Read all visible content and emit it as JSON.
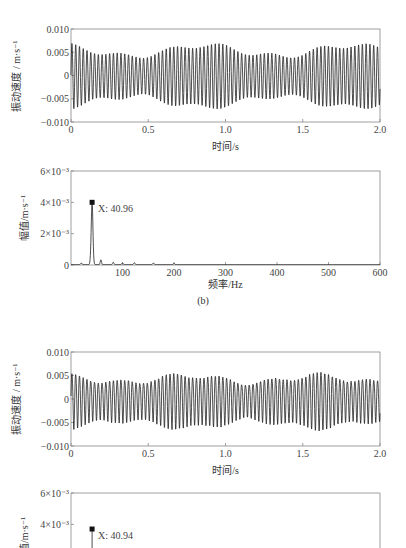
{
  "chart_data": [
    {
      "id": "wave1",
      "type": "line",
      "title": "",
      "xlabel": "时间/s",
      "ylabel": "振动速度 / m·s⁻¹",
      "xlim": [
        0,
        2.0
      ],
      "ylim": [
        -0.01,
        0.01
      ],
      "xticks": [
        "0",
        "0.5",
        "1.0",
        "1.5",
        "2.0"
      ],
      "yticks": [
        "0.010",
        "0.005",
        "0",
        "-0.005",
        "-0.010"
      ],
      "signal": {
        "frequency_hz": 40.96,
        "base_amplitude": 0.0055,
        "modulation_depth": 0.0012,
        "modulation_hz": 1.05,
        "noise": 0.0003
      },
      "grid": false
    },
    {
      "id": "spec1",
      "type": "line",
      "xlabel": "频率/Hz",
      "ylabel": "幅值/m·s⁻¹",
      "xlim": [
        0,
        600
      ],
      "ylim": [
        0,
        0.006
      ],
      "xticks": [
        "100",
        "200",
        "300",
        "400",
        "500",
        "600"
      ],
      "yticks": [
        "6×10⁻³",
        "4×10⁻³",
        "2×10⁻³",
        "0"
      ],
      "peaks": [
        {
          "x": 20,
          "y": 0.0001
        },
        {
          "x": 38,
          "y": 0.0002
        },
        {
          "x": 40.96,
          "y": 0.004
        },
        {
          "x": 58,
          "y": 0.0003
        },
        {
          "x": 82,
          "y": 0.00015
        },
        {
          "x": 100,
          "y": 0.0001
        },
        {
          "x": 123,
          "y": 0.00012
        },
        {
          "x": 160,
          "y": 0.0001
        },
        {
          "x": 200,
          "y": 8e-05
        }
      ],
      "annotation": {
        "label": "X: 40.96",
        "x": 40.96,
        "y": 0.004
      },
      "caption": "(b)"
    },
    {
      "id": "wave2",
      "type": "line",
      "xlabel": "时间/s",
      "ylabel": "振动速度 / m·s⁻¹",
      "xlim": [
        0,
        2.0
      ],
      "ylim": [
        -0.01,
        0.01
      ],
      "xticks": [
        "0",
        "0.5",
        "1.0",
        "1.5",
        "2.0"
      ],
      "yticks": [
        "0.010",
        "0.005",
        "0",
        "-0.005",
        "-0.010"
      ],
      "signal": {
        "frequency_hz": 40.94,
        "base_amplitude": 0.0048,
        "modulation_depth": 0.0008,
        "modulation_hz": 1.2,
        "noise": 0.0012
      },
      "grid": false
    },
    {
      "id": "spec2",
      "type": "line",
      "xlabel": "",
      "ylabel": "幅值/m·s⁻¹",
      "xlim": [
        0,
        600
      ],
      "ylim": [
        0,
        0.006
      ],
      "yticks": [
        "6×10⁻³",
        "4×10⁻³"
      ],
      "annotation": {
        "label": "X: 40.94",
        "x": 40.94,
        "y": 0.0037
      }
    }
  ],
  "labels": {
    "wave1_x": "时间/s",
    "wave1_y": "振动速度 / m·s⁻¹",
    "spec1_x": "频率/Hz",
    "spec1_y": "幅值/m·s⁻¹",
    "spec1_caption": "(b)",
    "spec1_annot": "X: 40.96",
    "wave2_x": "时间/s",
    "wave2_y": "振动速度 / m·s⁻¹",
    "spec2_y": "幅值/m·s⁻¹",
    "spec2_annot": "X: 40.94"
  }
}
